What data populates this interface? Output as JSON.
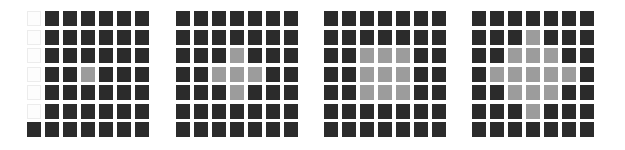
{
  "colors": {
    "dark": "#2b2b2b",
    "gray": "#9c9c9c",
    "white": "#fdfdfd"
  },
  "grids": [
    {
      "name": "grid-1",
      "left": 27,
      "legend": "d = dark cell, g = gray cell, w = white/empty cell",
      "rows": [
        "wdddddd",
        "wdddddd",
        "wdddddd",
        "wddgddd",
        "wdddddd",
        "wdddddd",
        "ddddddd"
      ]
    },
    {
      "name": "grid-2",
      "left": 176,
      "rows": [
        "ddddddd",
        "ddddddd",
        "dddgddd",
        "ddgggdd",
        "dddgddd",
        "ddddddd",
        "ddddddd"
      ]
    },
    {
      "name": "grid-3",
      "left": 324,
      "rows": [
        "ddddddd",
        "ddddddd",
        "ddgggdd",
        "ddgggdd",
        "ddgggdd",
        "ddddddd",
        "ddddddd"
      ]
    },
    {
      "name": "grid-4",
      "left": 472,
      "rows": [
        "ddddddd",
        "dddgddd",
        "ddgggdd",
        "dgggggd",
        "ddgggdd",
        "dddgddd",
        "ddddddd"
      ]
    }
  ]
}
